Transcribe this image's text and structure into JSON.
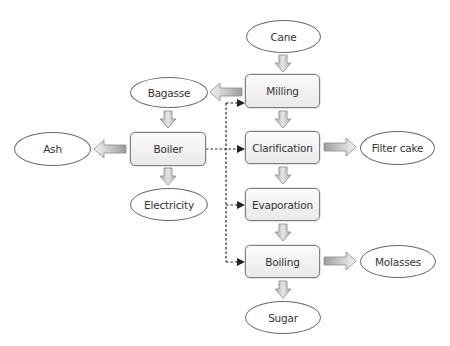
{
  "diagram": {
    "process_steps": [
      {
        "id": "milling",
        "label": "Milling"
      },
      {
        "id": "clarification",
        "label": "Clarification"
      },
      {
        "id": "evaporation",
        "label": "Evaporation"
      },
      {
        "id": "boiling",
        "label": "Boiling"
      },
      {
        "id": "boiler",
        "label": "Boiler"
      }
    ],
    "materials": [
      {
        "id": "cane",
        "label": "Cane"
      },
      {
        "id": "bagasse",
        "label": "Bagasse"
      },
      {
        "id": "ash",
        "label": "Ash"
      },
      {
        "id": "electricity",
        "label": "Electricity"
      },
      {
        "id": "filter_cake",
        "label": "Filter cake"
      },
      {
        "id": "molasses",
        "label": "Molasses"
      },
      {
        "id": "sugar",
        "label": "Sugar"
      }
    ],
    "flows": [
      {
        "from": "Cane",
        "to": "Milling",
        "type": "material"
      },
      {
        "from": "Milling",
        "to": "Bagasse",
        "type": "material"
      },
      {
        "from": "Milling",
        "to": "Clarification",
        "type": "material"
      },
      {
        "from": "Bagasse",
        "to": "Boiler",
        "type": "material"
      },
      {
        "from": "Boiler",
        "to": "Ash",
        "type": "material"
      },
      {
        "from": "Boiler",
        "to": "Electricity",
        "type": "material"
      },
      {
        "from": "Clarification",
        "to": "Filter cake",
        "type": "material"
      },
      {
        "from": "Clarification",
        "to": "Evaporation",
        "type": "material"
      },
      {
        "from": "Evaporation",
        "to": "Boiling",
        "type": "material"
      },
      {
        "from": "Boiling",
        "to": "Molasses",
        "type": "material"
      },
      {
        "from": "Boiling",
        "to": "Sugar",
        "type": "material"
      },
      {
        "from": "Boiler",
        "to": "Milling",
        "type": "energy-dashed"
      },
      {
        "from": "Boiler",
        "to": "Clarification",
        "type": "energy-dashed"
      },
      {
        "from": "Boiler",
        "to": "Evaporation",
        "type": "energy-dashed"
      },
      {
        "from": "Boiler",
        "to": "Boiling",
        "type": "energy-dashed"
      }
    ],
    "colors": {
      "node_border": "#7f7f7f",
      "ellipse_border": "#6a6a6a",
      "text": "#333333",
      "arrow_dark": "#9a9a9a",
      "arrow_light": "#f2f2f2",
      "dashed_line": "#222222"
    }
  }
}
